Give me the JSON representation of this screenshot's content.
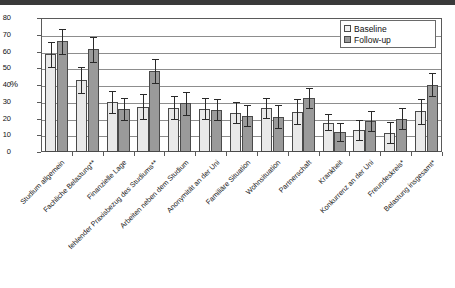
{
  "chart_data": {
    "type": "bar",
    "title": "",
    "subtitle": "",
    "xlabel": "",
    "ylabel": "%",
    "ylim": [
      0,
      80
    ],
    "ytick_step": 10,
    "yticks": [
      "0",
      "10",
      "20",
      "30",
      "40",
      "50",
      "60",
      "70",
      "80"
    ],
    "grid": true,
    "legend_position": "top-right",
    "error_bars": "95% CI (whiskers shown)",
    "categories": [
      "Studium allgemein",
      "Fachliche Belastung**",
      "Finanzielle Lage",
      "fehlender Praxisbezug des Studiums**",
      "Arbeiten neben dem Studium",
      "Anonymität an der Uni",
      "Familiäre Situation",
      "Wohnsituation",
      "Partnerschaft",
      "Krankheit",
      "Konkurrenz an der Uni",
      "Freundeskreis*",
      "Belastung insgesamt*"
    ],
    "series": [
      {
        "name": "Baseline",
        "color": "#e9e9e9",
        "values": [
          58.5,
          43.0,
          30.0,
          27.0,
          26.5,
          25.5,
          23.5,
          26.0,
          24.0,
          17.5,
          13.0,
          11.5,
          24.5
        ],
        "err_low": [
          51.0,
          35.5,
          23.5,
          19.5,
          19.5,
          19.5,
          17.5,
          20.5,
          16.5,
          13.0,
          7.0,
          5.5,
          17.0
        ],
        "err_high": [
          65.5,
          50.5,
          36.5,
          34.5,
          33.5,
          32.0,
          30.0,
          32.0,
          31.5,
          22.5,
          19.0,
          18.0,
          31.5
        ]
      },
      {
        "name": "Follow-up",
        "color": "#9a9a9a",
        "values": [
          66.0,
          61.5,
          25.5,
          48.5,
          29.0,
          25.0,
          21.5,
          21.0,
          32.0,
          12.0,
          18.5,
          20.0,
          40.0
        ],
        "err_low": [
          58.5,
          54.0,
          19.0,
          41.0,
          22.0,
          19.0,
          15.5,
          14.5,
          26.0,
          6.5,
          12.5,
          13.5,
          33.5
        ],
        "err_high": [
          73.5,
          68.5,
          32.5,
          55.5,
          36.0,
          31.5,
          28.0,
          28.0,
          38.5,
          17.5,
          24.5,
          26.5,
          47.0
        ]
      }
    ]
  },
  "legend": {
    "items": [
      {
        "label": "Baseline"
      },
      {
        "label": "Follow-up"
      }
    ]
  },
  "axis": {
    "y_title": "%"
  }
}
